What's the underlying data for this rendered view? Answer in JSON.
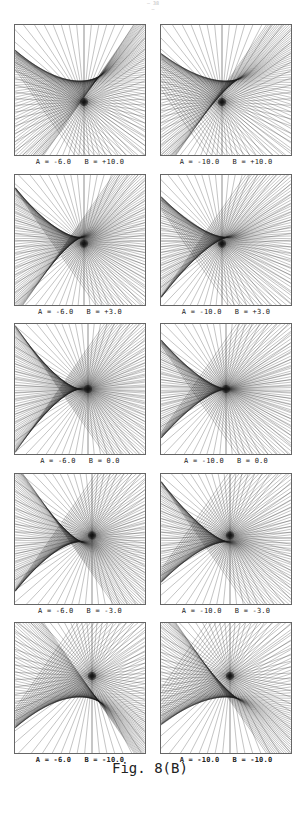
{
  "page": {
    "number": "— 38 —"
  },
  "figure": {
    "title": "Fig. 8(B)"
  },
  "panels": [
    {
      "id": "r1c1",
      "A": -6.0,
      "B": 10.0,
      "label": "A = -6.0   B = +10.0",
      "bold": false
    },
    {
      "id": "r1c2",
      "A": -10.0,
      "B": 10.0,
      "label": "A = -10.0   B = +10.0",
      "bold": false
    },
    {
      "id": "r2c1",
      "A": -6.0,
      "B": 3.0,
      "label": "A = -6.0   B = +3.0",
      "bold": false
    },
    {
      "id": "r2c2",
      "A": -10.0,
      "B": 3.0,
      "label": "A = -10.0   B = +3.0",
      "bold": false
    },
    {
      "id": "r3c1",
      "A": -6.0,
      "B": 0.0,
      "label": "A = -6.0   B = 0.0",
      "bold": false
    },
    {
      "id": "r3c2",
      "A": -10.0,
      "B": 0.0,
      "label": "A = -10.0   B = 0.0",
      "bold": false
    },
    {
      "id": "r4c1",
      "A": -6.0,
      "B": -3.0,
      "label": "A = -6.0   B = -3.0",
      "bold": false
    },
    {
      "id": "r4c2",
      "A": -10.0,
      "B": -3.0,
      "label": "A = -10.0   B = -3.0",
      "bold": false
    },
    {
      "id": "r5c1",
      "A": -6.0,
      "B": -10.0,
      "label": "A = -6.0   B = -10.0",
      "bold": true
    },
    {
      "id": "r5c2",
      "A": -10.0,
      "B": -10.0,
      "label": "A = -10.0   B = -10.0",
      "bold": true
    }
  ],
  "layout": {
    "col_x": [
      14,
      160
    ],
    "row_y": [
      24,
      174,
      323,
      473,
      622
    ],
    "frame_size": 132
  },
  "style": {
    "line_color": "#1a1a1a",
    "frame_color": "#666666"
  }
}
